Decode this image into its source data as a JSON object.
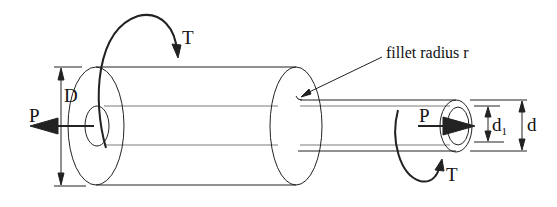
{
  "diagram": {
    "labels": {
      "torque_top": "T",
      "torque_bottom": "T",
      "axial_left": "P",
      "axial_right": "P",
      "large_diameter": "D",
      "small_diameter": "d",
      "bore_diameter": "d",
      "bore_subscript": "1",
      "fillet_note": "fillet radius r"
    },
    "colors": {
      "stroke": "#222222",
      "background": "#ffffff"
    }
  }
}
